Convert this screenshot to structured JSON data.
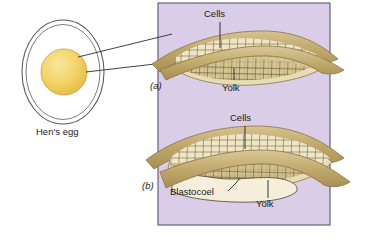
{
  "figure": {
    "egg_label": "Hen's egg",
    "panel_bg": "#d9cde7",
    "panel_border": "#6b6080",
    "yolk_color": "#f2d266",
    "membrane_color": "#c3ad74",
    "cells_color": "#efe6c8",
    "blastocoel_color": "#f3ecd7",
    "leader_color": "#2b2b38"
  },
  "panels": [
    {
      "marker": "(a)",
      "labels": [
        {
          "name": "cells",
          "text": "Cells"
        },
        {
          "name": "yolk",
          "text": "Yolk"
        }
      ]
    },
    {
      "marker": "(b)",
      "labels": [
        {
          "name": "cells",
          "text": "Cells"
        },
        {
          "name": "blastocoel",
          "text": "Blastocoel"
        },
        {
          "name": "yolk",
          "text": "Yolk"
        }
      ]
    }
  ]
}
